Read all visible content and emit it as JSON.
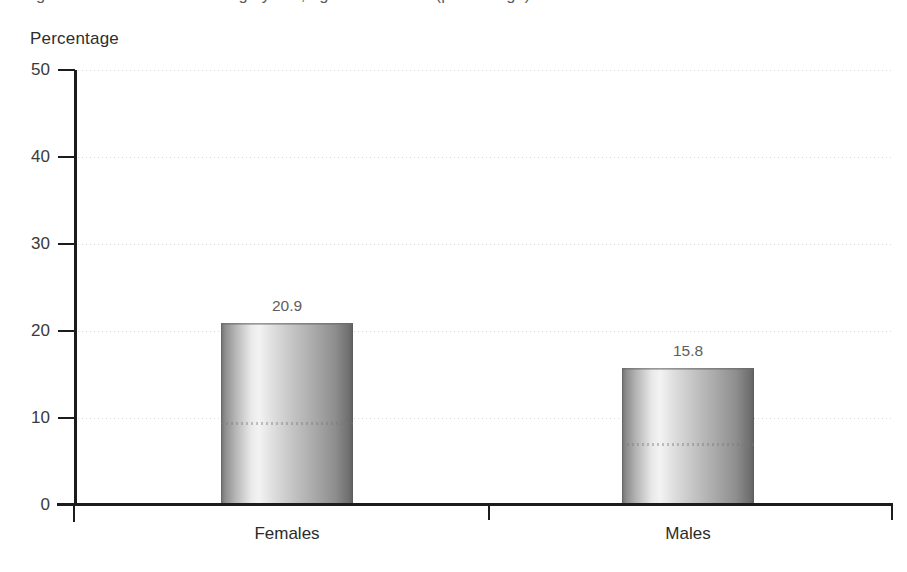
{
  "figure": {
    "cropped_title_sliver": "Figure: Prevalence of smoking by sex, age 15 and over (percentage)",
    "axis_title": "Percentage"
  },
  "chart_data": {
    "type": "bar",
    "title": "",
    "xlabel": "",
    "ylabel": "Percentage",
    "categories": [
      "Females",
      "Males"
    ],
    "values": [
      20.9,
      15.8
    ],
    "value_labels": [
      "20.9",
      "15.8"
    ],
    "ylim": [
      0,
      50
    ],
    "yticks": [
      0,
      10,
      20,
      30,
      40,
      50
    ],
    "ytick_labels": [
      "0",
      "10",
      "20",
      "30",
      "40",
      "50"
    ],
    "grid": "horizontal-dotted",
    "legend": "none",
    "series": [
      {
        "name": "Percentage",
        "values": [
          20.9,
          15.8
        ]
      }
    ],
    "colors": {
      "bar_light": "#f3f3f3",
      "bar_dark": "#5e5e5e",
      "axis": "#1c1c1c",
      "grid": "#d8d8d8",
      "value_label": "#5e5e5e",
      "background": "#ffffff"
    }
  }
}
